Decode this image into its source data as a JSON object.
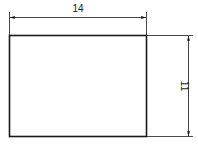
{
  "drawing": {
    "type": "dimensioned-rectangle",
    "width_dimension": "14",
    "height_dimension": "11",
    "line_color": "#1a1a1a"
  }
}
